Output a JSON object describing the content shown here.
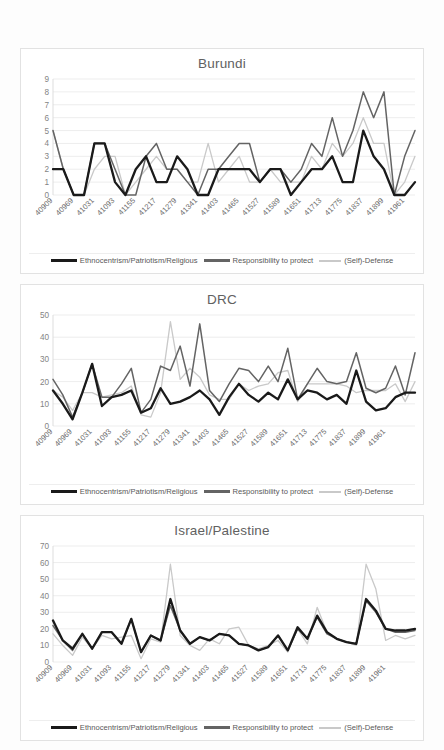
{
  "page": {
    "background_color": "#fdfdfd",
    "card_border_color": "#e2e2e2"
  },
  "legend": {
    "series": [
      {
        "label": "Ethnocentrism/Patriotism/Religious",
        "color": "#1a1a1a",
        "width": 2.6
      },
      {
        "label": "Responsibility to protect",
        "color": "#646464",
        "width": 1.9
      },
      {
        "label": "(Self)-Defense",
        "color": "#c9c9c9",
        "width": 1.6
      }
    ]
  },
  "x_tick_labels": [
    "40909",
    "40969",
    "41031",
    "41093",
    "41155",
    "41217",
    "41279",
    "41341",
    "41403",
    "41465",
    "41527",
    "41589",
    "41651",
    "41713",
    "41775",
    "41837",
    "41899",
    "41961"
  ],
  "chart_data": [
    {
      "type": "line",
      "title": "Burundi",
      "xlabel": "",
      "ylabel": "",
      "ylim": [
        0,
        9
      ],
      "ytick_step": 1,
      "yticks": [
        0,
        1,
        2,
        3,
        4,
        5,
        6,
        7,
        8,
        9
      ],
      "grid": true,
      "legend_position": "bottom",
      "x": [
        "40909",
        "40939",
        "40969",
        "41000",
        "41031",
        "41061",
        "41093",
        "41123",
        "41155",
        "41186",
        "41217",
        "41247",
        "41279",
        "41309",
        "41341",
        "41372",
        "41403",
        "41433",
        "41465",
        "41496",
        "41527",
        "41557",
        "41589",
        "41620",
        "41651",
        "41681",
        "41713",
        "41744",
        "41775",
        "41806",
        "41837",
        "41867",
        "41899",
        "41929",
        "41961",
        "41991"
      ],
      "categories": [
        "40909",
        "40939",
        "40969",
        "41000",
        "41031",
        "41061",
        "41093",
        "41123",
        "41155",
        "41186",
        "41217",
        "41247",
        "41279",
        "41309",
        "41341",
        "41372",
        "41403",
        "41433",
        "41465",
        "41496",
        "41527",
        "41557",
        "41589",
        "41620",
        "41651",
        "41681",
        "41713",
        "41744",
        "41775",
        "41806",
        "41837",
        "41867",
        "41899",
        "41929",
        "41961",
        "41991"
      ],
      "series": [
        {
          "name": "Ethnocentrism/Patriotism/Religious",
          "color": "#1a1a1a",
          "values": [
            2,
            2,
            0,
            0,
            4,
            4,
            1,
            0,
            2,
            3,
            1,
            1,
            3,
            2,
            0,
            0,
            2,
            2,
            2,
            2,
            1,
            2,
            2,
            0,
            1,
            2,
            2,
            3,
            1,
            1,
            5,
            3,
            2,
            0,
            0,
            1
          ]
        },
        {
          "name": "Responsibility to protect",
          "color": "#646464",
          "values": [
            5,
            2,
            0,
            0,
            4,
            4,
            2,
            0,
            0,
            3,
            4,
            2,
            2,
            1,
            0,
            2,
            2,
            3,
            4,
            4,
            1,
            2,
            2,
            1,
            2,
            4,
            3,
            6,
            3,
            5,
            8,
            6,
            8,
            0,
            3,
            5
          ]
        },
        {
          "name": "(Self)-Defense",
          "color": "#c9c9c9",
          "values": [
            5,
            2,
            0,
            0,
            2,
            3,
            3,
            0,
            1,
            2,
            3,
            2,
            2,
            1,
            1,
            4,
            1,
            2,
            3,
            1,
            1,
            2,
            1,
            1,
            1,
            3,
            2,
            4,
            3,
            4,
            6,
            4,
            4,
            0,
            1,
            3
          ]
        }
      ]
    },
    {
      "type": "line",
      "title": "DRC",
      "xlabel": "",
      "ylabel": "",
      "ylim": [
        0,
        50
      ],
      "ytick_step": 10,
      "yticks": [
        0,
        10,
        20,
        30,
        40,
        50
      ],
      "grid": true,
      "legend_position": "bottom",
      "x": [
        "40909",
        "40939",
        "40969",
        "41000",
        "41031",
        "41061",
        "41093",
        "41123",
        "41155",
        "41186",
        "41217",
        "41247",
        "41279",
        "41309",
        "41341",
        "41372",
        "41403",
        "41433",
        "41465",
        "41496",
        "41527",
        "41557",
        "41589",
        "41620",
        "41651",
        "41681",
        "41713",
        "41744",
        "41775",
        "41806",
        "41837",
        "41867",
        "41899",
        "41929",
        "41961",
        "41991"
      ],
      "categories": [
        "40909",
        "40939",
        "40969",
        "41000",
        "41031",
        "41061",
        "41093",
        "41123",
        "41155",
        "41186",
        "41217",
        "41247",
        "41279",
        "41309",
        "41341",
        "41372",
        "41403",
        "41433",
        "41465",
        "41496",
        "41527",
        "41557",
        "41589",
        "41620",
        "41651",
        "41681",
        "41713",
        "41744",
        "41775",
        "41806",
        "41837",
        "41867",
        "41899",
        "41929",
        "41961",
        "41991"
      ],
      "series": [
        {
          "name": "Ethnocentrism/Patriotism/Religious",
          "color": "#1a1a1a",
          "values": [
            16,
            10,
            3,
            15,
            28,
            9,
            13,
            14,
            16,
            6,
            8,
            17,
            10,
            11,
            13,
            16,
            12,
            5,
            13,
            19,
            14,
            11,
            15,
            12,
            21,
            12,
            16,
            15,
            12,
            14,
            10,
            25,
            11,
            7,
            8,
            13,
            15,
            15
          ]
        },
        {
          "name": "Responsibility to protect",
          "color": "#646464",
          "values": [
            21,
            14,
            4,
            15,
            28,
            13,
            13,
            19,
            26,
            6,
            12,
            27,
            25,
            36,
            18,
            46,
            16,
            11,
            19,
            26,
            25,
            20,
            27,
            20,
            35,
            12,
            19,
            26,
            20,
            19,
            20,
            33,
            17,
            15,
            17,
            27,
            14,
            33
          ]
        },
        {
          "name": "(Self)-Defense",
          "color": "#c9c9c9",
          "values": [
            16,
            13,
            7,
            15,
            15,
            13,
            14,
            15,
            18,
            5,
            4,
            15,
            47,
            21,
            26,
            22,
            14,
            12,
            12,
            19,
            16,
            18,
            19,
            24,
            25,
            11,
            19,
            19,
            19,
            19,
            18,
            15,
            16,
            16,
            16,
            19,
            11,
            20
          ]
        }
      ]
    },
    {
      "type": "line",
      "title": "Israel/Palestine",
      "xlabel": "",
      "ylabel": "",
      "ylim": [
        0,
        70
      ],
      "ytick_step": 10,
      "yticks": [
        0,
        10,
        20,
        30,
        40,
        50,
        60,
        70
      ],
      "grid": true,
      "legend_position": "bottom",
      "x": [
        "40909",
        "40939",
        "40969",
        "41000",
        "41031",
        "41061",
        "41093",
        "41123",
        "41155",
        "41186",
        "41217",
        "41247",
        "41279",
        "41309",
        "41341",
        "41372",
        "41403",
        "41433",
        "41465",
        "41496",
        "41527",
        "41557",
        "41589",
        "41620",
        "41651",
        "41681",
        "41713",
        "41744",
        "41775",
        "41806",
        "41837",
        "41867",
        "41899",
        "41929",
        "41961",
        "41991"
      ],
      "categories": [
        "40909",
        "40939",
        "40969",
        "41000",
        "41031",
        "41061",
        "41093",
        "41123",
        "41155",
        "41186",
        "41217",
        "41247",
        "41279",
        "41309",
        "41341",
        "41372",
        "41403",
        "41433",
        "41465",
        "41496",
        "41527",
        "41557",
        "41589",
        "41620",
        "41651",
        "41681",
        "41713",
        "41744",
        "41775",
        "41806",
        "41837",
        "41867",
        "41899",
        "41929",
        "41961",
        "41991"
      ],
      "series": [
        {
          "name": "Ethnocentrism/Patriotism/Religious",
          "color": "#1a1a1a",
          "values": [
            25,
            13,
            8,
            17,
            8,
            18,
            18,
            11,
            26,
            6,
            16,
            13,
            38,
            19,
            11,
            15,
            13,
            17,
            16,
            11,
            10,
            7,
            9,
            16,
            7,
            21,
            14,
            28,
            18,
            14,
            12,
            11,
            38,
            31,
            20,
            19,
            19,
            20
          ]
        },
        {
          "name": "Responsibility to protect",
          "color": "#646464",
          "values": [
            22,
            13,
            7,
            17,
            8,
            18,
            18,
            11,
            26,
            6,
            16,
            13,
            34,
            19,
            11,
            15,
            13,
            17,
            16,
            11,
            10,
            7,
            9,
            16,
            7,
            20,
            14,
            27,
            17,
            14,
            12,
            11,
            37,
            30,
            20,
            18,
            18,
            19
          ]
        },
        {
          "name": "(Self)-Defense",
          "color": "#c9c9c9",
          "values": [
            17,
            10,
            4,
            15,
            8,
            16,
            14,
            15,
            16,
            2,
            14,
            12,
            59,
            16,
            10,
            7,
            14,
            11,
            20,
            21,
            10,
            8,
            10,
            13,
            6,
            20,
            11,
            33,
            18,
            14,
            12,
            10,
            59,
            44,
            13,
            16,
            14,
            16
          ]
        }
      ]
    }
  ]
}
